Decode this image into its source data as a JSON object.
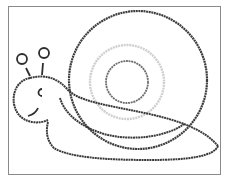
{
  "image": {
    "subject": "snail drawn with micrography text",
    "description": "Line drawing of a snail whose outlines are made of tiny handwritten text, inside a thin gray rectangular frame",
    "colors": {
      "background": "#ffffff",
      "frame": "#8a8a8a",
      "ink": "#333333",
      "faint_ring": "#c8c8c8",
      "inner_ring": "#777777"
    }
  }
}
